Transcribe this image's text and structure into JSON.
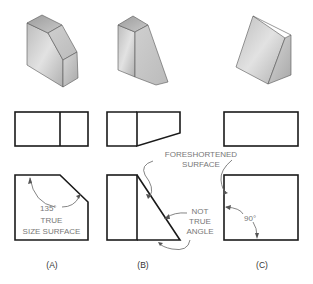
{
  "figure": {
    "panels": [
      {
        "id": "A",
        "caption": "(A)",
        "annotations": {
          "angle": "135°",
          "note_line1": "TRUE",
          "note_line2": "SIZE SURFACE"
        }
      },
      {
        "id": "B",
        "caption": "(B)",
        "annotations": {
          "note_line1": "NOT",
          "note_line2": "TRUE",
          "note_line3": "ANGLE"
        }
      },
      {
        "id": "C",
        "caption": "(C)",
        "annotations": {
          "angle": "90°"
        }
      }
    ],
    "shared_label": {
      "line1": "FORESHORTENED",
      "line2": "SURFACE"
    },
    "colors": {
      "line": "#1a1a1a",
      "annotation_text": "#777777",
      "face_light": "#d6d6d6",
      "face_mid": "#bdbdbd",
      "face_dark": "#a3a3a3"
    }
  }
}
